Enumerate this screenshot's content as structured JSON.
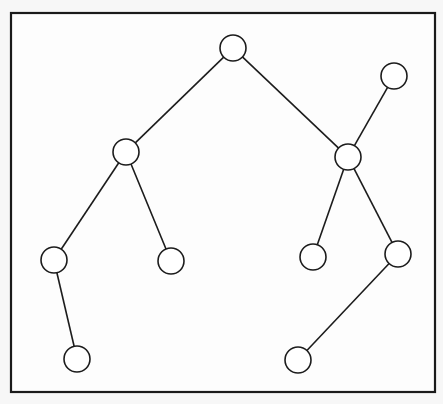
{
  "diagram": {
    "type": "tree-graph",
    "frame": {
      "x": 11,
      "y": 13,
      "width": 424,
      "height": 379
    },
    "node_radius": 13,
    "colors": {
      "stroke": "#1c1c1c",
      "node_fill": "#ffffff",
      "background": "#fdfdfd"
    },
    "nodes": [
      {
        "id": "root",
        "x": 233,
        "y": 48
      },
      {
        "id": "right-top",
        "x": 394,
        "y": 76
      },
      {
        "id": "left-1",
        "x": 126,
        "y": 152
      },
      {
        "id": "right-1",
        "x": 348,
        "y": 157
      },
      {
        "id": "left-left-2",
        "x": 54,
        "y": 260
      },
      {
        "id": "left-right-2",
        "x": 171,
        "y": 261
      },
      {
        "id": "right-left-2",
        "x": 313,
        "y": 257
      },
      {
        "id": "right-right-2",
        "x": 398,
        "y": 254
      },
      {
        "id": "left-left-3",
        "x": 77,
        "y": 359
      },
      {
        "id": "right-right-3",
        "x": 298,
        "y": 360
      }
    ],
    "edges": [
      {
        "from": "root",
        "to": "left-1"
      },
      {
        "from": "root",
        "to": "right-1"
      },
      {
        "from": "right-top",
        "to": "right-1"
      },
      {
        "from": "left-1",
        "to": "left-left-2"
      },
      {
        "from": "left-1",
        "to": "left-right-2"
      },
      {
        "from": "right-1",
        "to": "right-left-2"
      },
      {
        "from": "right-1",
        "to": "right-right-2"
      },
      {
        "from": "left-left-2",
        "to": "left-left-3"
      },
      {
        "from": "right-right-2",
        "to": "right-right-3"
      }
    ]
  }
}
